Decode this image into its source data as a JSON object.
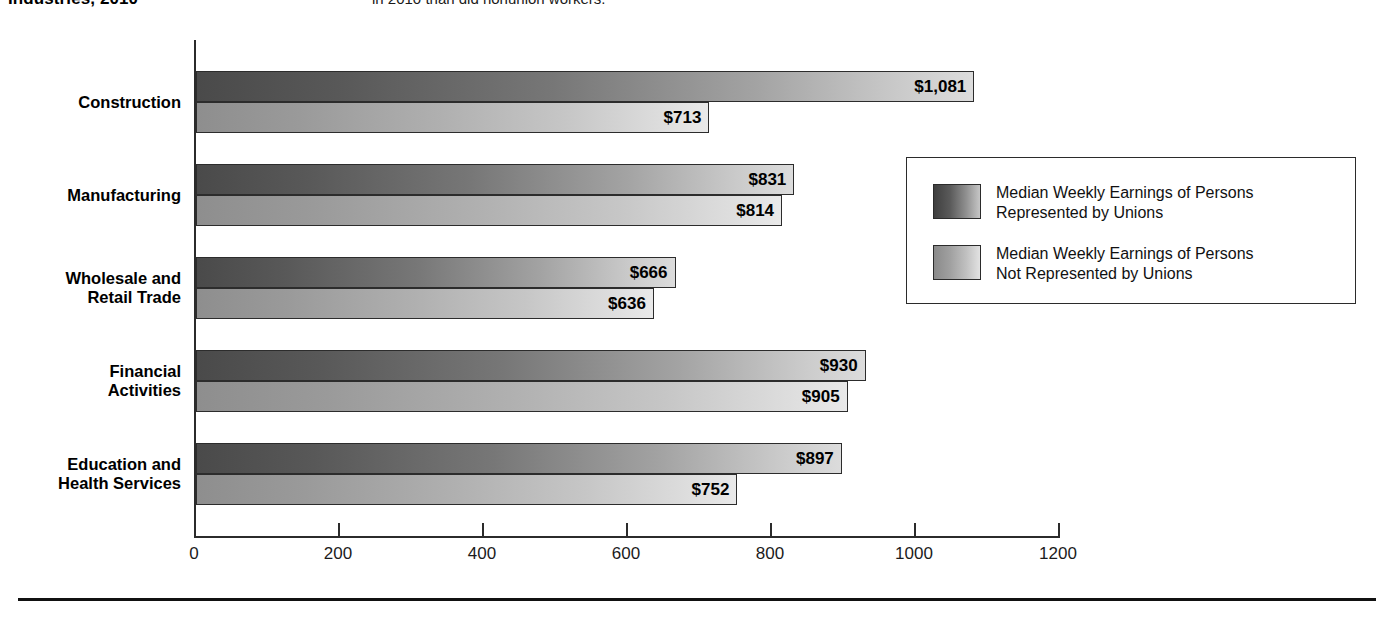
{
  "headline": {
    "left": "Industries, 2010",
    "right": "in 2010 than did nonunion workers."
  },
  "chart_data": {
    "type": "bar",
    "orientation": "horizontal",
    "title": "",
    "xlabel": "",
    "ylabel": "",
    "xlim": [
      0,
      1200
    ],
    "grid": false,
    "legend_position": "right",
    "categories": [
      "Construction",
      "Manufacturing",
      "Wholesale and\nRetail Trade",
      "Financial\nActivities",
      "Education and\nHealth Services"
    ],
    "tick_labels": [
      "0",
      "200",
      "400",
      "600",
      "800",
      "1000",
      "1200"
    ],
    "tick_values": [
      0,
      200,
      400,
      600,
      800,
      1000,
      1200
    ],
    "series": [
      {
        "name": "Median Weekly Earnings of Persons\nRepresented by Unions",
        "key": "union",
        "values": [
          1081,
          831,
          666,
          930,
          897
        ],
        "labels": [
          "$1,081",
          "$831",
          "$666",
          "$930",
          "$897"
        ]
      },
      {
        "name": "Median Weekly Earnings of Persons\nNot Represented by Unions",
        "key": "nonunion",
        "values": [
          713,
          814,
          636,
          905,
          752
        ],
        "labels": [
          "$713",
          "$814",
          "$636",
          "$905",
          "$752"
        ]
      }
    ]
  },
  "legend": {
    "items": [
      {
        "swatch": "union-swatch",
        "text": "Median Weekly Earnings of Persons\nRepresented by Unions"
      },
      {
        "swatch": "nonunion-swatch",
        "text": "Median Weekly Earnings of Persons\nNot Represented by Unions"
      }
    ]
  }
}
